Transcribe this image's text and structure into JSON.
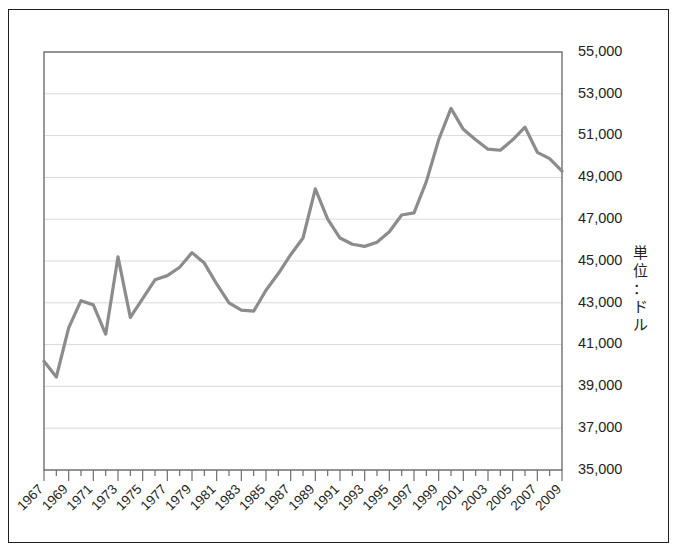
{
  "chart_data": {
    "type": "line",
    "title": "",
    "subtitle": "",
    "xlabel": "",
    "ylabel": "単位：ドル",
    "ylabel_chars": [
      "単",
      "位",
      "：",
      "ド",
      "ル"
    ],
    "xlim": [
      1967,
      2009
    ],
    "ylim": [
      35000,
      55000
    ],
    "ytick_step": 2000,
    "grid": true,
    "grid_axis": "y",
    "legend": false,
    "legend_position": "none",
    "line_color": "#8c8c8c",
    "line_width": 3.2,
    "frame_color": "#231f20",
    "gridline_color": "#d9d9d9",
    "ytick_labels": [
      "55,000",
      "53,000",
      "51,000",
      "49,000",
      "47,000",
      "45,000",
      "43,000",
      "41,000",
      "39,000",
      "37,000",
      "35,000"
    ],
    "ytick_values": [
      55000,
      53000,
      51000,
      49000,
      47000,
      45000,
      43000,
      41000,
      39000,
      37000,
      35000
    ],
    "xtick_labels": [
      "1967",
      "1969",
      "1971",
      "1973",
      "1975",
      "1977",
      "1979",
      "1981",
      "1983",
      "1985",
      "1987",
      "1989",
      "1991",
      "1993",
      "1995",
      "1997",
      "1999",
      "2001",
      "2003",
      "2005",
      "2007",
      "2009"
    ],
    "xtick_label_rotation": -45,
    "xtick_minor_every": 1,
    "x": [
      1967,
      1968,
      1969,
      1970,
      1971,
      1972,
      1973,
      1974,
      1975,
      1976,
      1977,
      1978,
      1979,
      1980,
      1981,
      1982,
      1983,
      1984,
      1985,
      1986,
      1987,
      1988,
      1989,
      1990,
      1991,
      1992,
      1993,
      1994,
      1995,
      1996,
      1997,
      1998,
      1999,
      2000,
      2001,
      2002,
      2003,
      2004,
      2005,
      2006,
      2007,
      2008,
      2009
    ],
    "series": [
      {
        "name": "所得",
        "values": [
          40200,
          39450,
          41800,
          43100,
          42900,
          41500,
          45200,
          42300,
          43200,
          44100,
          44300,
          44700,
          45400,
          44900,
          43900,
          43000,
          42650,
          42600,
          43600,
          44400,
          45300,
          46100,
          48450,
          47000,
          46100,
          45800,
          45700,
          45900,
          46400,
          47200,
          47300,
          48800,
          50800,
          52300,
          51300,
          50800,
          50350,
          50300,
          50800,
          51400,
          50200,
          49900,
          49300
        ]
      }
    ]
  }
}
